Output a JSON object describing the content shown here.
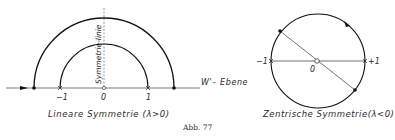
{
  "figure": {
    "caption": "Abb. 77"
  },
  "left_diagram": {
    "title": "Lineare Symmetrie (λ>0)",
    "symmetry_line_label": "Symmetrie-linie",
    "plane_label": "W'– Ebene",
    "axis_ticks": [
      "−1",
      "0",
      "1"
    ],
    "outer_arc": {
      "center": [
        104,
        88
      ],
      "radius": 70
    },
    "inner_arc": {
      "center": [
        104,
        88
      ],
      "radius": 44
    }
  },
  "right_diagram": {
    "title": "Zentrische Symmetrie(λ<0)",
    "axis_ticks": [
      "−1",
      "0",
      "+1"
    ],
    "circle": {
      "center": [
        318,
        61
      ],
      "radius": 47
    }
  },
  "colors": {
    "line": "#1a1a1a",
    "text": "#2a2a2a",
    "background": "#ffffff"
  }
}
